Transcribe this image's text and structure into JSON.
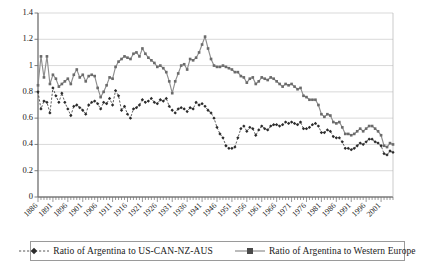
{
  "chart_data": {
    "type": "line",
    "title": "",
    "subtitle": "",
    "xlabel": "",
    "ylabel": "",
    "xlim": [
      1886,
      2005
    ],
    "ylim": [
      0,
      1.4
    ],
    "ytick_labels": [
      "0",
      "0.2",
      "0.4",
      "0.6",
      "0.8",
      "1",
      "1.2",
      "1.4"
    ],
    "ytick_values": [
      0,
      0.2,
      0.4,
      0.6,
      0.8,
      1.0,
      1.2,
      1.4
    ],
    "xtick_labels": [
      "1886",
      "1891",
      "1896",
      "1901",
      "1906",
      "1911",
      "1916",
      "1921",
      "1926",
      "1931",
      "1936",
      "1941",
      "1946",
      "1951",
      "1956",
      "1961",
      "1966",
      "1971",
      "1976",
      "1981",
      "1986",
      "1991",
      "1996",
      "2001"
    ],
    "xtick_values": [
      1886,
      1891,
      1896,
      1901,
      1906,
      1911,
      1916,
      1921,
      1926,
      1931,
      1936,
      1941,
      1946,
      1951,
      1956,
      1961,
      1966,
      1971,
      1976,
      1981,
      1986,
      1991,
      1996,
      2001
    ],
    "grid": true,
    "grid_axis": "y",
    "legend_position": "bottom",
    "colors": {
      "series_a": "#2b2b2b",
      "series_b": "#8e8e8e",
      "gridline": "#c8c8c8",
      "axis": "#7a7a7a",
      "background": "#ffffff"
    },
    "x": [
      1886,
      1887,
      1888,
      1889,
      1890,
      1891,
      1892,
      1893,
      1894,
      1895,
      1896,
      1897,
      1898,
      1899,
      1900,
      1901,
      1902,
      1903,
      1904,
      1905,
      1906,
      1907,
      1908,
      1909,
      1910,
      1911,
      1912,
      1913,
      1914,
      1915,
      1916,
      1917,
      1918,
      1919,
      1920,
      1921,
      1922,
      1923,
      1924,
      1925,
      1926,
      1927,
      1928,
      1929,
      1930,
      1931,
      1932,
      1933,
      1934,
      1935,
      1936,
      1937,
      1938,
      1939,
      1940,
      1941,
      1942,
      1943,
      1944,
      1945,
      1946,
      1947,
      1948,
      1949,
      1950,
      1951,
      1952,
      1953,
      1954,
      1955,
      1956,
      1957,
      1958,
      1959,
      1960,
      1961,
      1962,
      1963,
      1964,
      1965,
      1966,
      1967,
      1968,
      1969,
      1970,
      1971,
      1972,
      1973,
      1974,
      1975,
      1976,
      1977,
      1978,
      1979,
      1980,
      1981,
      1982,
      1983,
      1984,
      1985,
      1986,
      1987,
      1988,
      1989,
      1990,
      1991,
      1992,
      1993,
      1994,
      1995,
      1996,
      1997,
      1998,
      1999,
      2000,
      2001,
      2002,
      2003,
      2004,
      2005
    ],
    "series": [
      {
        "name": "Ratio of Argentina to US-CAN-NZ-AUS",
        "marker": "diamond",
        "linestyle": "dashed",
        "color": "#2b2b2b",
        "values": [
          0.8,
          0.67,
          0.73,
          0.72,
          0.64,
          0.83,
          0.77,
          0.72,
          0.79,
          0.72,
          0.67,
          0.62,
          0.69,
          0.7,
          0.68,
          0.66,
          0.63,
          0.7,
          0.72,
          0.73,
          0.71,
          0.67,
          0.72,
          0.71,
          0.75,
          0.7,
          0.81,
          0.77,
          0.66,
          0.69,
          0.63,
          0.6,
          0.67,
          0.68,
          0.7,
          0.74,
          0.72,
          0.73,
          0.75,
          0.72,
          0.71,
          0.74,
          0.73,
          0.75,
          0.69,
          0.66,
          0.64,
          0.67,
          0.68,
          0.67,
          0.65,
          0.68,
          0.67,
          0.72,
          0.7,
          0.71,
          0.69,
          0.66,
          0.64,
          0.6,
          0.53,
          0.48,
          0.45,
          0.39,
          0.37,
          0.37,
          0.38,
          0.45,
          0.52,
          0.54,
          0.5,
          0.53,
          0.52,
          0.47,
          0.51,
          0.54,
          0.52,
          0.51,
          0.54,
          0.55,
          0.55,
          0.54,
          0.55,
          0.57,
          0.56,
          0.57,
          0.56,
          0.55,
          0.57,
          0.52,
          0.52,
          0.53,
          0.55,
          0.56,
          0.54,
          0.49,
          0.49,
          0.51,
          0.5,
          0.46,
          0.45,
          0.45,
          0.42,
          0.37,
          0.37,
          0.36,
          0.37,
          0.39,
          0.41,
          0.4,
          0.42,
          0.44,
          0.44,
          0.42,
          0.41,
          0.39,
          0.33,
          0.32,
          0.35,
          0.34
        ]
      },
      {
        "name": "Ratio of Argentina to Western Europe",
        "marker": "square",
        "linestyle": "solid",
        "color": "#8e8e8e",
        "values": [
          0.85,
          1.07,
          0.91,
          1.07,
          0.86,
          0.93,
          0.9,
          0.84,
          0.86,
          0.88,
          0.9,
          0.86,
          0.93,
          0.97,
          0.91,
          0.93,
          0.88,
          0.92,
          0.93,
          0.92,
          0.83,
          0.76,
          0.8,
          0.85,
          0.91,
          0.9,
          0.99,
          1.03,
          1.05,
          1.07,
          1.06,
          1.05,
          1.09,
          1.1,
          1.07,
          1.13,
          1.09,
          1.06,
          1.04,
          1.02,
          0.99,
          1.0,
          0.98,
          0.95,
          0.88,
          0.79,
          0.88,
          0.94,
          1.0,
          1.01,
          0.97,
          1.05,
          1.04,
          1.06,
          1.1,
          1.16,
          1.22,
          1.13,
          1.05,
          1.0,
          0.99,
          0.99,
          1.0,
          0.99,
          0.98,
          0.97,
          0.95,
          0.95,
          0.92,
          0.91,
          0.87,
          0.9,
          0.91,
          0.86,
          0.88,
          0.91,
          0.9,
          0.89,
          0.91,
          0.9,
          0.88,
          0.86,
          0.84,
          0.86,
          0.85,
          0.86,
          0.84,
          0.82,
          0.83,
          0.77,
          0.76,
          0.74,
          0.74,
          0.74,
          0.7,
          0.63,
          0.61,
          0.63,
          0.62,
          0.57,
          0.56,
          0.57,
          0.53,
          0.48,
          0.48,
          0.47,
          0.48,
          0.5,
          0.52,
          0.5,
          0.52,
          0.54,
          0.54,
          0.52,
          0.5,
          0.47,
          0.39,
          0.38,
          0.41,
          0.4
        ]
      }
    ]
  },
  "legend": {
    "entries": [
      {
        "label": "Ratio of Argentina to US-CAN-NZ-AUS"
      },
      {
        "label": "Ratio of Argentina to Western Europe"
      }
    ]
  }
}
